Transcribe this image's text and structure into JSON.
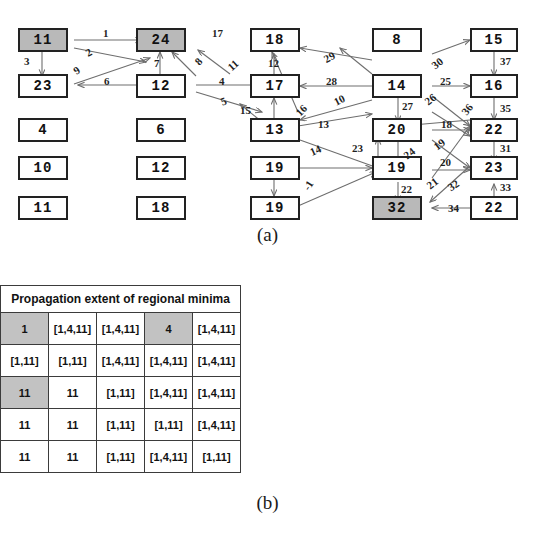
{
  "figure": {
    "caption_a": "(a)",
    "caption_b": "(b)"
  },
  "graph": {
    "nodes": [
      {
        "id": "n-c1r1",
        "label": "11",
        "shaded": true
      },
      {
        "id": "n-c1r2",
        "label": "23",
        "shaded": false
      },
      {
        "id": "n-c1r3",
        "label": "4",
        "shaded": false
      },
      {
        "id": "n-c1r4",
        "label": "10",
        "shaded": false
      },
      {
        "id": "n-c1r5",
        "label": "11",
        "shaded": false
      },
      {
        "id": "n-c2r1",
        "label": "24",
        "shaded": true
      },
      {
        "id": "n-c2r2",
        "label": "12",
        "shaded": false
      },
      {
        "id": "n-c2r3",
        "label": "6",
        "shaded": false
      },
      {
        "id": "n-c2r4",
        "label": "12",
        "shaded": false
      },
      {
        "id": "n-c2r5",
        "label": "18",
        "shaded": false
      },
      {
        "id": "n-c3r1",
        "label": "18",
        "shaded": false
      },
      {
        "id": "n-c3r2",
        "label": "17",
        "shaded": false
      },
      {
        "id": "n-c3r3",
        "label": "13",
        "shaded": false
      },
      {
        "id": "n-c3r4",
        "label": "19",
        "shaded": false
      },
      {
        "id": "n-c3r5",
        "label": "19",
        "shaded": false
      },
      {
        "id": "n-c4r1",
        "label": "8",
        "shaded": false
      },
      {
        "id": "n-c4r2",
        "label": "14",
        "shaded": false
      },
      {
        "id": "n-c4r3",
        "label": "20",
        "shaded": false
      },
      {
        "id": "n-c4r4",
        "label": "19",
        "shaded": false
      },
      {
        "id": "n-c4r5",
        "label": "32",
        "shaded": true
      },
      {
        "id": "n-c5r1",
        "label": "15",
        "shaded": false
      },
      {
        "id": "n-c5r2",
        "label": "16",
        "shaded": false
      },
      {
        "id": "n-c5r3",
        "label": "22",
        "shaded": false
      },
      {
        "id": "n-c5r4",
        "label": "23",
        "shaded": false
      },
      {
        "id": "n-c5r5",
        "label": "22",
        "shaded": false
      }
    ],
    "edge_labels": [
      {
        "id": "e1",
        "label": "1"
      },
      {
        "id": "e2",
        "label": "2"
      },
      {
        "id": "e3",
        "label": "3"
      },
      {
        "id": "e4",
        "label": "4"
      },
      {
        "id": "e5",
        "label": "5"
      },
      {
        "id": "e6",
        "label": "6"
      },
      {
        "id": "e7",
        "label": "7"
      },
      {
        "id": "e8",
        "label": "8"
      },
      {
        "id": "e9",
        "label": "9"
      },
      {
        "id": "e10",
        "label": "10"
      },
      {
        "id": "e11",
        "label": "11"
      },
      {
        "id": "e12",
        "label": "12"
      },
      {
        "id": "e13",
        "label": "13"
      },
      {
        "id": "e14",
        "label": "14"
      },
      {
        "id": "e15",
        "label": "15"
      },
      {
        "id": "e16",
        "label": "16"
      },
      {
        "id": "e17",
        "label": "17"
      },
      {
        "id": "e18",
        "label": "18"
      },
      {
        "id": "e19",
        "label": "19"
      },
      {
        "id": "e20",
        "label": "20"
      },
      {
        "id": "e21",
        "label": "21"
      },
      {
        "id": "e22",
        "label": "22"
      },
      {
        "id": "e23",
        "label": "23"
      },
      {
        "id": "e24",
        "label": "24"
      },
      {
        "id": "e25",
        "label": "25"
      },
      {
        "id": "e26",
        "label": "26"
      },
      {
        "id": "e27",
        "label": "27"
      },
      {
        "id": "e28",
        "label": "28"
      },
      {
        "id": "e29",
        "label": "29"
      },
      {
        "id": "e30",
        "label": "30"
      },
      {
        "id": "e31",
        "label": "31"
      },
      {
        "id": "e32",
        "label": "32"
      },
      {
        "id": "e33",
        "label": "33"
      },
      {
        "id": "e34",
        "label": "34"
      },
      {
        "id": "e35",
        "label": "35"
      },
      {
        "id": "e36",
        "label": "36"
      },
      {
        "id": "e37",
        "label": "37"
      },
      {
        "id": "eneg1",
        "label": "-1"
      }
    ],
    "colors": {
      "node_border": "#222222",
      "node_fill": "#ffffff",
      "node_shaded_fill": "#b9b9b9",
      "edge": "#6e6e6e"
    }
  },
  "tables": {
    "maxima": {
      "title": "Propagation extent of regional maxima",
      "rows": [
        [
          {
            "v": "[2,24]",
            "s": false
          },
          {
            "v": "2",
            "s": true
          },
          {
            "v": "2",
            "s": false
          },
          {
            "v": "[2,24]",
            "s": false
          },
          {
            "v": "24",
            "s": false
          }
        ],
        [
          {
            "v": "2",
            "s": false
          },
          {
            "v": "[2,24]",
            "s": false
          },
          {
            "v": "[2,24]",
            "s": false
          },
          {
            "v": "[2,24]",
            "s": false
          },
          {
            "v": "24",
            "s": false
          }
        ],
        [
          {
            "v": "[2,24]",
            "s": false
          },
          {
            "v": "[2,24]",
            "s": false
          },
          {
            "v": "[2,24]",
            "s": false
          },
          {
            "v": "24",
            "s": false
          },
          {
            "v": "24",
            "s": false
          }
        ],
        [
          {
            "v": "[2,24]",
            "s": false
          },
          {
            "v": "[2,24]",
            "s": false
          },
          {
            "v": "24",
            "s": false
          },
          {
            "v": "24",
            "s": false
          },
          {
            "v": "24",
            "s": false
          }
        ],
        [
          {
            "v": "[2,24]",
            "s": false
          },
          {
            "v": "24",
            "s": false
          },
          {
            "v": "24",
            "s": false
          },
          {
            "v": "24",
            "s": true
          },
          {
            "v": "24",
            "s": false
          }
        ]
      ]
    },
    "minima": {
      "title": "Propagation extent of regional minima",
      "rows": [
        [
          {
            "v": "1",
            "s": true
          },
          {
            "v": "[1,4,11]",
            "s": false
          },
          {
            "v": "[1,4,11]",
            "s": false
          },
          {
            "v": "4",
            "s": true
          },
          {
            "v": "[1,4,11]",
            "s": false
          }
        ],
        [
          {
            "v": "[1,11]",
            "s": false
          },
          {
            "v": "[1,11]",
            "s": false
          },
          {
            "v": "[1,4,11]",
            "s": false
          },
          {
            "v": "[1,4,11]",
            "s": false
          },
          {
            "v": "[1,4,11]",
            "s": false
          }
        ],
        [
          {
            "v": "11",
            "s": true
          },
          {
            "v": "11",
            "s": false
          },
          {
            "v": "[1,11]",
            "s": false
          },
          {
            "v": "[1,4,11]",
            "s": false
          },
          {
            "v": "[1,4,11]",
            "s": false
          }
        ],
        [
          {
            "v": "11",
            "s": false
          },
          {
            "v": "11",
            "s": false
          },
          {
            "v": "[1,11]",
            "s": false
          },
          {
            "v": "[1,11]",
            "s": false
          },
          {
            "v": "[1,4,11]",
            "s": false
          }
        ],
        [
          {
            "v": "11",
            "s": false
          },
          {
            "v": "11",
            "s": false
          },
          {
            "v": "[1,11]",
            "s": false
          },
          {
            "v": "[1,4,11]",
            "s": false
          },
          {
            "v": "[1,11]",
            "s": false
          }
        ]
      ]
    }
  }
}
